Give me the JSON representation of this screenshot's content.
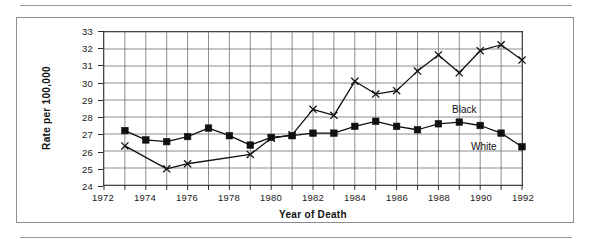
{
  "chart_data": {
    "type": "line",
    "title": "",
    "xlabel": "Year of Death",
    "ylabel": "Rate per 100,000",
    "xlim": [
      1972,
      1992
    ],
    "ylim": [
      24,
      33
    ],
    "xticks": [
      1972,
      1974,
      1976,
      1978,
      1980,
      1982,
      1984,
      1986,
      1988,
      1990,
      1992
    ],
    "xtick_labels": [
      "1972",
      "1974",
      "1976",
      "1978",
      "1980",
      "1982",
      "1984",
      "1986",
      "1988",
      "1990",
      "1992"
    ],
    "yticks": [
      24,
      25,
      26,
      27,
      28,
      29,
      30,
      31,
      32,
      33
    ],
    "ytick_labels": [
      "24",
      "25",
      "26",
      "27",
      "28",
      "29",
      "30",
      "31",
      "32",
      "33"
    ],
    "grid": true,
    "grid_x_step": 1,
    "grid_y_step": 1,
    "legend_position": "inline-annotation",
    "x": [
      1973,
      1974,
      1975,
      1976,
      1977,
      1978,
      1979,
      1980,
      1981,
      1982,
      1983,
      1984,
      1985,
      1986,
      1987,
      1988,
      1989,
      1990,
      1991,
      1992
    ],
    "series": [
      {
        "name": "White",
        "marker": "square",
        "color": "#111111",
        "values": [
          27.2,
          26.65,
          26.55,
          26.85,
          27.35,
          26.9,
          26.35,
          26.8,
          26.9,
          27.05,
          27.05,
          27.45,
          27.75,
          27.45,
          27.25,
          27.6,
          27.7,
          27.5,
          27.05,
          26.25
        ]
      },
      {
        "name": "Black",
        "marker": "x",
        "color": "#111111",
        "values": [
          26.3,
          null,
          24.95,
          25.25,
          null,
          null,
          25.8,
          26.75,
          26.95,
          28.45,
          28.1,
          30.1,
          29.35,
          29.55,
          30.7,
          31.65,
          30.6,
          31.9,
          32.25,
          31.35
        ]
      }
    ],
    "annotations": [
      {
        "text": "Black",
        "x": 1988.1,
        "y": 28.7
      },
      {
        "text": "White",
        "x": 1989.0,
        "y": 26.55
      }
    ]
  },
  "colors": {
    "ink": "#111111",
    "axis": "#2b2b2b",
    "grid": "#6e6e6e",
    "frame": "#8d8d8d",
    "rule": "#9a9a9a",
    "background": "#ffffff"
  }
}
